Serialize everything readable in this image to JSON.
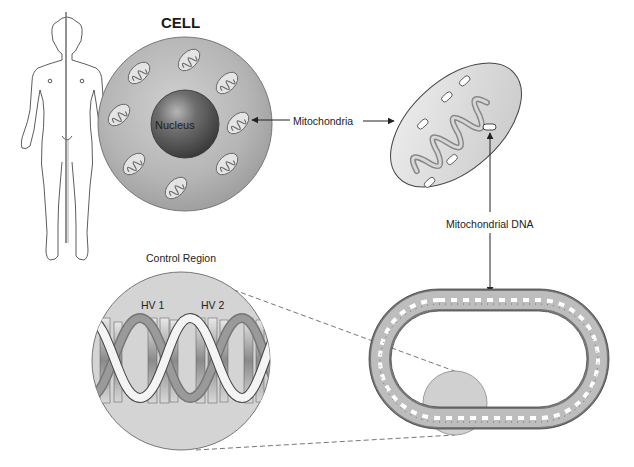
{
  "diagram": {
    "title": "CELL",
    "labels": {
      "cell": "CELL",
      "nucleus": "Nucleus",
      "mitochondria": "Mitochondria",
      "mitochondrial_dna": "Mitochondrial DNA",
      "control_region": "Control Region",
      "hv1": "HV 1",
      "hv2": "HV 2"
    },
    "elements": {
      "human_figure": "human-body-outline",
      "cell": "cell-with-mitochondria",
      "mitochondrion": "mitochondrion-cross-section",
      "mtdna_ring": "circular-mitochondrial-dna",
      "control_region_zoom": "control-region-magnified-helix"
    },
    "colors": {
      "cell_fill": "#b8b8b8",
      "cell_edge": "#8a8a8a",
      "nucleus_fill": "#5a5a5a",
      "mito_fill": "#dadada",
      "cristae": "#9a9a9a",
      "zoom_circle": "#d4d4d4",
      "line": "#2a2a2a",
      "dashed": "#666666"
    }
  }
}
